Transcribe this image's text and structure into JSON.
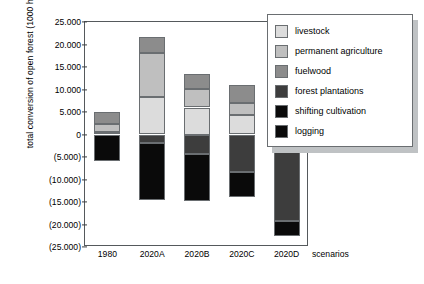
{
  "chart_data": {
    "type": "bar",
    "stacked": true,
    "title": "",
    "xlabel": "scenarios",
    "ylabel": "total conversion of open forest (1000 ha/yr)",
    "categories": [
      "1980",
      "2020A",
      "2020B",
      "2020C",
      "2020D"
    ],
    "ylim": [
      -25000,
      25000
    ],
    "ytick_values": [
      25000,
      20000,
      15000,
      10000,
      5000,
      0,
      -5000,
      -10000,
      -15000,
      -20000,
      -25000
    ],
    "ytick_labels": [
      "25.000",
      "20.000",
      "15.000",
      "10.000",
      "5.000",
      "0",
      "(5.000)",
      "(10.000)",
      "(15.000)",
      "(20.000)",
      "(25.000)"
    ],
    "grid": false,
    "legend_position": "top-right",
    "series": [
      {
        "name": "livestock",
        "color": "#dcdcdc",
        "values": [
          600,
          8300,
          6000,
          4400,
          1300
        ]
      },
      {
        "name": "permanent agriculture",
        "color": "#bfbfbf",
        "values": [
          1700,
          9800,
          4100,
          2500,
          2900
        ]
      },
      {
        "name": "fuelwood",
        "color": "#8c8c8c",
        "values": [
          2600,
          3600,
          3300,
          4000,
          3000
        ]
      },
      {
        "name": "forest plantations",
        "color": "#3d3d3d",
        "values": [
          -200,
          -1800,
          -4400,
          -8300,
          -19200
        ]
      },
      {
        "name": "shifting cultivation",
        "color": "#0a0a0a",
        "values": [
          -5800,
          -12800,
          -10300,
          -5600,
          -3300
        ]
      },
      {
        "name": "logging",
        "color": "#0a0a0a",
        "values": [
          0,
          0,
          0,
          0,
          0
        ]
      }
    ]
  },
  "legend": {
    "items": [
      {
        "label": "livestock"
      },
      {
        "label": "permanent agriculture"
      },
      {
        "label": "fuelwood"
      },
      {
        "label": "forest plantations"
      },
      {
        "label": "shifting cultivation"
      },
      {
        "label": "logging"
      }
    ]
  }
}
